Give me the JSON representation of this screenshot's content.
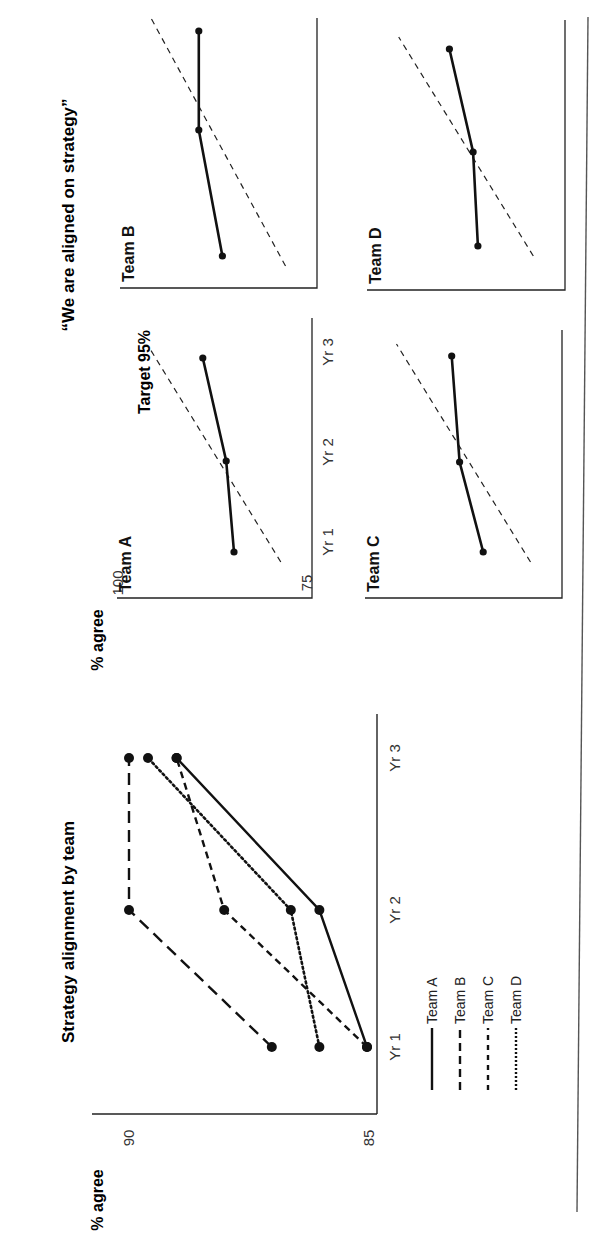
{
  "page": {
    "orientation": "rotated-90-ccw",
    "rule_color": "#555555",
    "ink_color": "#111111"
  },
  "chart_data": [
    {
      "id": "strategy-alignment-by-team",
      "type": "line",
      "title": "Strategy alignment by team",
      "xlabel": "",
      "ylabel": "% agree",
      "categories": [
        "Yr 1",
        "Yr 2",
        "Yr 3"
      ],
      "ylim": [
        85,
        90
      ],
      "yticks": [
        85,
        90
      ],
      "grid": false,
      "legend_position": "below",
      "series": [
        {
          "name": "Team A",
          "style": "solid",
          "values": [
            85.0,
            86.0,
            89.0
          ]
        },
        {
          "name": "Team B",
          "style": "long-dash",
          "values": [
            87.0,
            90.0,
            90.0
          ]
        },
        {
          "name": "Team C",
          "style": "short-dash",
          "values": [
            85.0,
            88.0,
            89.0
          ]
        },
        {
          "name": "Team D",
          "style": "dotted",
          "values": [
            86.0,
            86.6,
            89.6
          ]
        }
      ]
    },
    {
      "id": "we-are-aligned-on-strategy",
      "type": "line",
      "title": "“We are aligned on strategy”",
      "ylabel": "% agree",
      "categories": [
        "Yr 1",
        "Yr 2",
        "Yr 3"
      ],
      "ylim": [
        75,
        100
      ],
      "yticks": [
        75,
        100
      ],
      "grid": false,
      "annotation": "Target 95%",
      "target_line": {
        "label": "Target 95%",
        "style": "dashed",
        "values": [
          80,
          87.5,
          95
        ]
      },
      "panels": [
        {
          "name": "Team A",
          "values": [
            85.0,
            86.0,
            89.0
          ]
        },
        {
          "name": "Team B",
          "values": [
            87.0,
            90.0,
            90.0
          ]
        },
        {
          "name": "Team C",
          "values": [
            85.0,
            88.0,
            89.0
          ]
        },
        {
          "name": "Team D",
          "values": [
            86.0,
            86.6,
            89.6
          ]
        }
      ]
    }
  ],
  "left_chart": {
    "title": "Strategy alignment by team",
    "ylabel": "% agree",
    "ytick_low": "85",
    "ytick_high": "90",
    "xticks": [
      "Yr 1",
      "Yr 2",
      "Yr 3"
    ],
    "legend": [
      {
        "label": "Team A",
        "style": "solid"
      },
      {
        "label": "Team B",
        "style": "long-dash"
      },
      {
        "label": "Team C",
        "style": "short-dash"
      },
      {
        "label": "Team D",
        "style": "dotted"
      }
    ]
  },
  "right_chart": {
    "title": "“We are aligned on strategy”",
    "ylabel": "% agree",
    "ytick_low": "75",
    "ytick_high": "100",
    "xticks": [
      "Yr 1",
      "Yr 2",
      "Yr 3"
    ],
    "target_label": "Target 95%",
    "panel_labels": [
      "Team A",
      "Team B",
      "Team C",
      "Team D"
    ]
  }
}
